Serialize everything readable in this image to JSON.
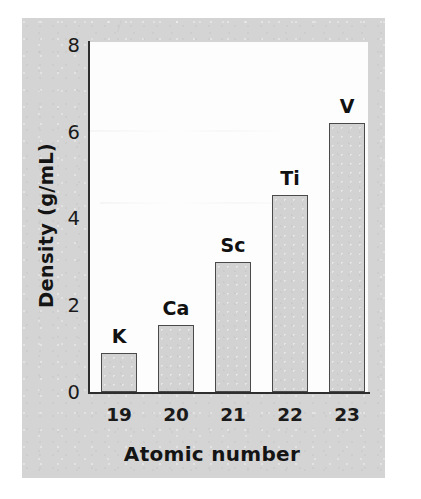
{
  "figure": {
    "background_color": "#d4d4d4",
    "plot_background_color": "#fdfdfd",
    "axis_color": "#2e2e2e",
    "bar_fill_color": "#d2d2d2",
    "bar_border_color": "#4a4a4a"
  },
  "chart_data": {
    "type": "bar",
    "title": "",
    "xlabel": "Atomic number",
    "ylabel": "Density (g/mL)",
    "categories": [
      "19",
      "20",
      "21",
      "22",
      "23"
    ],
    "values": [
      0.9,
      1.55,
      3.0,
      4.55,
      6.2
    ],
    "bar_labels": [
      "K",
      "Ca",
      "Sc",
      "Ti",
      "V"
    ],
    "ylim": [
      0,
      8
    ],
    "ytick_labels": [
      "0",
      "2",
      "4",
      "6",
      "8"
    ],
    "ytick_values": [
      0,
      2,
      4,
      6,
      8
    ],
    "xtick_labels": [
      "19",
      "20",
      "21",
      "22",
      "23"
    ],
    "grid": false,
    "legend": false,
    "series": [
      {
        "name": "Density",
        "values": [
          0.9,
          1.55,
          3.0,
          4.55,
          6.2
        ]
      }
    ]
  }
}
